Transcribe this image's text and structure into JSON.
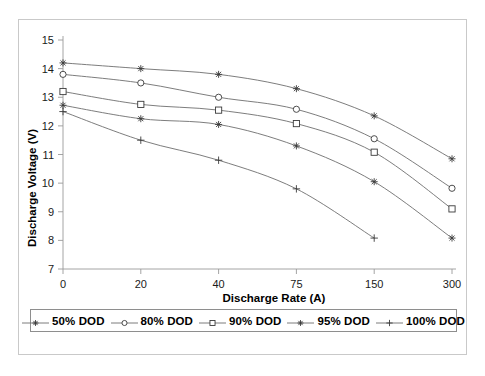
{
  "chart_data": {
    "type": "line",
    "title": "",
    "xlabel": "Discharge Rate (A)",
    "ylabel": "Discharge Voltage (V)",
    "categories": [
      "0",
      "20",
      "40",
      "75",
      "150",
      "300"
    ],
    "x": [
      0,
      20,
      40,
      75,
      150,
      300
    ],
    "ylim": [
      7,
      15
    ],
    "yticks": [
      7,
      8,
      9,
      10,
      11,
      12,
      13,
      14,
      15
    ],
    "ytick_labels": [
      "7",
      "8",
      "9",
      "10",
      "11",
      "12",
      "13",
      "14",
      "15"
    ],
    "xtick_labels": [
      "0",
      "20",
      "40",
      "75",
      "150",
      "300"
    ],
    "grid": false,
    "legend_position": "bottom",
    "axis_spacing": "categorical",
    "series": [
      {
        "name": "50% DOD",
        "marker": "asterisk",
        "values": [
          14.2,
          14.0,
          13.8,
          13.3,
          12.35,
          10.85
        ]
      },
      {
        "name": "80% DOD",
        "marker": "circle",
        "values": [
          13.8,
          13.5,
          13.0,
          12.58,
          11.55,
          9.82
        ]
      },
      {
        "name": "90% DOD",
        "marker": "square",
        "values": [
          13.2,
          12.75,
          12.55,
          12.08,
          11.08,
          9.1
        ]
      },
      {
        "name": "95% DOD",
        "marker": "star",
        "values": [
          12.72,
          12.25,
          12.05,
          11.3,
          10.05,
          8.08
        ]
      },
      {
        "name": "100% DOD",
        "marker": "plus",
        "values": [
          12.5,
          11.5,
          10.8,
          9.8,
          8.08,
          null
        ]
      }
    ],
    "colors": {
      "line": "#6e6e6e",
      "marker": "#3a3a3a",
      "axis": "#9a9a9a",
      "text": "#000000",
      "frame": "#c9c9c9",
      "legend_border": "#8e8e8e",
      "background": "#ffffff"
    }
  },
  "legend": {
    "entries": [
      {
        "label": "50% DOD",
        "marker": "asterisk"
      },
      {
        "label": "80% DOD",
        "marker": "circle"
      },
      {
        "label": "90% DOD",
        "marker": "square"
      },
      {
        "label": "95% DOD",
        "marker": "star"
      },
      {
        "label": "100% DOD",
        "marker": "plus"
      }
    ]
  }
}
